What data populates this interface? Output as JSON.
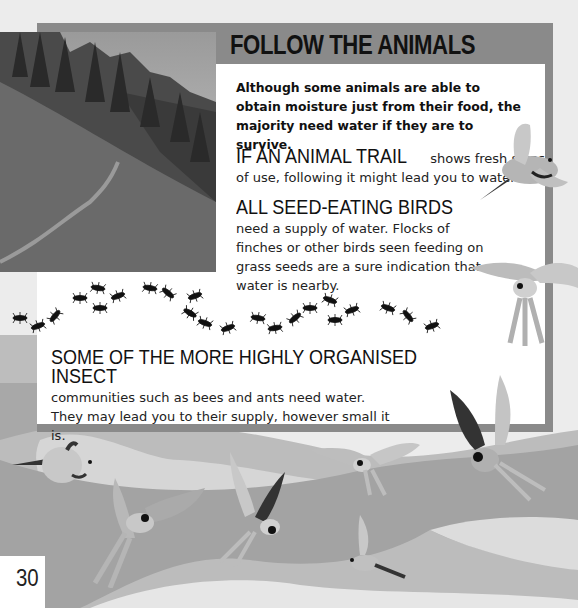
{
  "page": {
    "title": "FOLLOW THE ANIMALS",
    "intro": "Although some animals are able to obtain moisture just from their food, the majority need water if they are to survive.",
    "sections": [
      {
        "heading": "IF AN ANIMAL TRAIL",
        "body": " shows fresh signs of use, following it might lead you to water."
      },
      {
        "heading": "ALL SEED-EATING BIRDS",
        "body": "need a supply of water. Flocks of finches or other birds seen feeding on grass seeds are a sure indication that water is nearby."
      },
      {
        "heading": "SOME OF THE MORE HIGHLY ORGANISED INSECT",
        "body": "communities such as bees and ants need water. They may lead you to their supply, however small it is."
      }
    ],
    "page_number": "30"
  },
  "images": {
    "photo": "mountain-trail-photo",
    "ants": "ant-trail-illustration",
    "birds": "flying-macaws-illustration"
  },
  "colors": {
    "frame": "#8a8a8a",
    "panel": "#ffffff",
    "background": "#ececec",
    "band": "#a3a3a3"
  }
}
